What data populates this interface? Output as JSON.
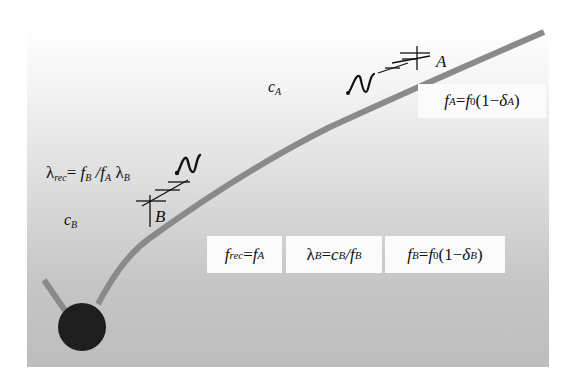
{
  "diagram": {
    "colors": {
      "curve": "#8a8a8a",
      "ball": "#1e1e1e",
      "panel_top": "#ffffff",
      "panel_bottom": "#bdbdbd",
      "box_fill": "#fbfbfb"
    },
    "points": {
      "A": "A",
      "B": "B"
    },
    "labels": {
      "c_A": {
        "base": "c",
        "sub": "A"
      },
      "c_B": {
        "base": "c",
        "sub": "B"
      },
      "lambda_rec": {
        "lhs": "λ",
        "lhs_sub": "rec",
        "eq": "= ",
        "f1": "f",
        "f1_sub": "B",
        "slash": " /",
        "f2": "f",
        "f2_sub": "A",
        "lam": " λ",
        "lam_sub": "B"
      }
    },
    "boxes": {
      "f_A": {
        "f": "f",
        "f_sub": "A",
        "eq": " = ",
        "f0": "f",
        "f0_sub": "0",
        "paren_open": "(1−",
        "delta": "δ",
        "delta_sub": "A",
        "paren_close": ")"
      },
      "f_rec": {
        "f": "f",
        "f_sub": "rec",
        "eq": " = ",
        "f2": "f",
        "f2_sub": "A"
      },
      "lambda_B": {
        "lam": "λ",
        "lam_sub": "B",
        "eq": " =",
        "c": "c",
        "c_sub": "B",
        "slash": " /",
        "f": "f",
        "f_sub": "B"
      },
      "f_B": {
        "f": "f",
        "f_sub": "B",
        "eq": " = ",
        "f0": "f",
        "f0_sub": "0",
        "paren_open": "(1−",
        "delta": "δ",
        "delta_sub": "B",
        "paren_close": ")"
      }
    }
  }
}
